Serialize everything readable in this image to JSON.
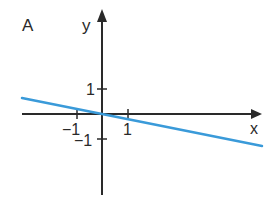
{
  "panel_label": "A",
  "colors": {
    "axis": "#2a2a2a",
    "line": "#3a9ad9",
    "background": "#ffffff"
  },
  "chart_data": {
    "type": "line",
    "title": "A",
    "xlabel": "x",
    "ylabel": "y",
    "x_ticks": [
      {
        "value": -1,
        "label": "−1"
      },
      {
        "value": 1,
        "label": "1"
      }
    ],
    "y_ticks": [
      {
        "value": 1,
        "label": "1"
      },
      {
        "value": -1,
        "label": "−1"
      }
    ],
    "xlim": [
      -3.2,
      6.4
    ],
    "ylim": [
      -3.2,
      4.2
    ],
    "grid": false,
    "legend": null,
    "series": [
      {
        "name": "line",
        "equation": "y = -0.2x",
        "slope": -0.2,
        "intercept": 0,
        "x": [
          -3.2,
          6.4
        ],
        "y": [
          0.64,
          -1.28
        ]
      }
    ]
  }
}
